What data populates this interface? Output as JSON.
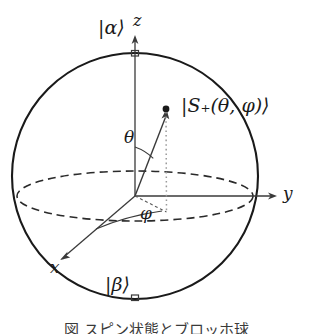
{
  "figure": {
    "kind": "bloch-sphere-diagram",
    "caption": "図 スピン状態とブロッホ球",
    "stroke_color": "#1a1a1a",
    "background_color": "#ffffff"
  },
  "labels": {
    "north_pole_state": "|α⟩",
    "south_pole_state": "|β⟩",
    "z_axis": "z",
    "y_axis": "y",
    "x_axis": "x",
    "polar_angle": "θ",
    "azimuthal_angle": "φ",
    "state_vector": "|S₊(θ, φ)⟩"
  },
  "geometry": {
    "sphere": {
      "center_x": 135,
      "center_y": 176,
      "radius": 123
    },
    "equator_ellipse": {
      "center_x": 135,
      "center_y": 196,
      "rx": 118,
      "ry": 25,
      "style": "dashed"
    },
    "origin": {
      "x": 135,
      "y": 196
    },
    "z_axis_tip": {
      "x": 135,
      "y": 36
    },
    "y_axis_tip": {
      "x": 277,
      "y": 196
    },
    "x_axis_tip": {
      "x": 60,
      "y": 259
    },
    "state_vector_tip": {
      "x": 165,
      "y": 110
    },
    "projection_point": {
      "x": 166,
      "y": 212
    }
  }
}
